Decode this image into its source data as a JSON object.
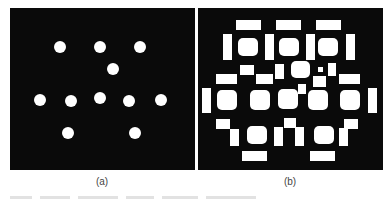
{
  "figure": {
    "panels": [
      {
        "id": "a",
        "label": "(a)",
        "background": "#0a0a0a",
        "description": "11 white circular dots on black",
        "dots": [
          {
            "x": 60,
            "y": 47
          },
          {
            "x": 100,
            "y": 47
          },
          {
            "x": 140,
            "y": 47
          },
          {
            "x": 113,
            "y": 69
          },
          {
            "x": 40,
            "y": 100
          },
          {
            "x": 71,
            "y": 101
          },
          {
            "x": 100,
            "y": 98
          },
          {
            "x": 129,
            "y": 101
          },
          {
            "x": 161,
            "y": 100
          },
          {
            "x": 68,
            "y": 133
          },
          {
            "x": 135,
            "y": 133
          }
        ],
        "dot_radius": 6
      },
      {
        "id": "b",
        "label": "(b)",
        "background": "#0a0a0a",
        "description": "white blobs surrounded by white rectangular fragments on black"
      }
    ],
    "caption": "",
    "caption_note": "faint, truncated caption line below panels (illegible)"
  }
}
